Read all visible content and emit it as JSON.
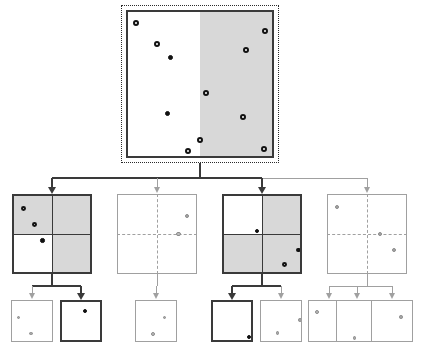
{
  "figure": {
    "type": "diagram",
    "colors": {
      "region_fill_gray": "#d8d8d8",
      "region_fill_white": "#ffffff",
      "active_stroke": "#3a3a3a",
      "inactive_stroke": "#a0a0a0",
      "point_filled": "#111111",
      "point_ring_dark": "#111111",
      "point_gray": "#a8a8a8"
    },
    "levels": 3
  },
  "root": {
    "id": "root-node",
    "label": "root-partition",
    "state": "active",
    "outer_border": "dotted",
    "splits": {
      "vertical": 0.5,
      "horizontal": 0.5
    },
    "quadrants": {
      "tl": "white",
      "tr": "gray",
      "bl": "white",
      "br": "gray"
    },
    "points": [
      {
        "x": 0.07,
        "y": 0.09,
        "style": "ring-dark"
      },
      {
        "x": 0.21,
        "y": 0.23,
        "style": "ring-dark"
      },
      {
        "x": 0.3,
        "y": 0.32,
        "style": "filled"
      },
      {
        "x": 0.94,
        "y": 0.14,
        "style": "ring-dark"
      },
      {
        "x": 0.81,
        "y": 0.27,
        "style": "ring-dark"
      },
      {
        "x": 0.54,
        "y": 0.56,
        "style": "ring-dark"
      },
      {
        "x": 0.28,
        "y": 0.7,
        "style": "filled"
      },
      {
        "x": 0.79,
        "y": 0.72,
        "style": "ring-dark"
      },
      {
        "x": 0.5,
        "y": 0.88,
        "style": "ring-dark"
      },
      {
        "x": 0.42,
        "y": 0.95,
        "style": "ring-dark"
      },
      {
        "x": 0.93,
        "y": 0.94,
        "style": "ring-dark"
      }
    ]
  },
  "level2": [
    {
      "id": "node-l2-1",
      "label": "child-1",
      "state": "active",
      "split_style": "solid",
      "splits": {
        "vertical": 0.5,
        "horizontal": 0.5
      },
      "quadrants": {
        "tl": "gray",
        "tr": "gray",
        "bl": "white",
        "br": "gray"
      },
      "points": [
        {
          "x": 0.14,
          "y": 0.18,
          "style": "ring-dark"
        },
        {
          "x": 0.28,
          "y": 0.38,
          "style": "ring-dark"
        },
        {
          "x": 0.38,
          "y": 0.58,
          "style": "filled"
        }
      ]
    },
    {
      "id": "node-l2-2",
      "label": "child-2",
      "state": "inactive",
      "split_style": "dashed",
      "splits": {
        "vertical": 0.5,
        "horizontal": 0.5
      },
      "quadrants": {
        "tl": "white",
        "tr": "white",
        "bl": "white",
        "br": "white"
      },
      "points": [
        {
          "x": 0.87,
          "y": 0.28,
          "style": "gray-solid"
        },
        {
          "x": 0.77,
          "y": 0.5,
          "style": "ring-gray"
        }
      ]
    },
    {
      "id": "node-l2-3",
      "label": "child-3",
      "state": "active",
      "split_style": "solid",
      "splits": {
        "vertical": 0.5,
        "horizontal": 0.5
      },
      "quadrants": {
        "tl": "white",
        "tr": "gray",
        "bl": "gray",
        "br": "gray"
      },
      "points": [
        {
          "x": 0.44,
          "y": 0.46,
          "style": "filled"
        },
        {
          "x": 0.96,
          "y": 0.7,
          "style": "ring-dark"
        },
        {
          "x": 0.78,
          "y": 0.88,
          "style": "ring-dark"
        }
      ]
    },
    {
      "id": "node-l2-4",
      "label": "child-4",
      "state": "inactive",
      "split_style": "dashed",
      "splits": {
        "vertical": 0.5,
        "horizontal": 0.5
      },
      "quadrants": {
        "tl": "white",
        "tr": "white",
        "bl": "white",
        "br": "white"
      },
      "points": [
        {
          "x": 0.13,
          "y": 0.16,
          "style": "gray-solid"
        },
        {
          "x": 0.66,
          "y": 0.5,
          "style": "gray-solid"
        },
        {
          "x": 0.84,
          "y": 0.7,
          "style": "gray-solid"
        }
      ]
    }
  ],
  "level3": [
    {
      "id": "node-l3-1",
      "label": "leaf-1",
      "state": "inactive",
      "parent": "node-l2-1",
      "points": [
        {
          "x": 0.18,
          "y": 0.42,
          "style": "gray-solid"
        },
        {
          "x": 0.47,
          "y": 0.8,
          "style": "gray-solid"
        }
      ]
    },
    {
      "id": "node-l3-2",
      "label": "leaf-2",
      "state": "active",
      "parent": "node-l2-1",
      "points": [
        {
          "x": 0.6,
          "y": 0.26,
          "style": "filled"
        }
      ]
    },
    {
      "id": "node-l3-3",
      "label": "leaf-3",
      "state": "inactive",
      "parent": "node-l2-2",
      "points": [
        {
          "x": 0.7,
          "y": 0.42,
          "style": "gray-solid"
        },
        {
          "x": 0.44,
          "y": 0.82,
          "style": "ring-gray"
        }
      ]
    },
    {
      "id": "node-l3-4",
      "label": "leaf-4",
      "state": "active",
      "parent": "node-l2-3",
      "points": [
        {
          "x": 0.9,
          "y": 0.88,
          "style": "filled"
        }
      ]
    },
    {
      "id": "node-l3-5",
      "label": "leaf-5",
      "state": "inactive",
      "parent": "node-l2-3",
      "points": [
        {
          "x": 0.95,
          "y": 0.48,
          "style": "gray-solid"
        },
        {
          "x": 0.42,
          "y": 0.78,
          "style": "gray-solid"
        }
      ]
    },
    {
      "id": "node-l3-6",
      "label": "leaf-6",
      "state": "inactive",
      "parent": "node-l2-4",
      "points": [
        {
          "x": 0.22,
          "y": 0.28,
          "style": "ring-gray"
        }
      ]
    },
    {
      "id": "node-l3-7",
      "label": "leaf-7",
      "state": "inactive",
      "parent": "node-l2-4",
      "points": [
        {
          "x": 0.44,
          "y": 0.9,
          "style": "gray-solid"
        }
      ]
    },
    {
      "id": "node-l3-8",
      "label": "leaf-8",
      "state": "inactive",
      "parent": "node-l2-4",
      "points": [
        {
          "x": 0.72,
          "y": 0.4,
          "style": "gray-solid"
        }
      ]
    }
  ],
  "geometry": {
    "root": {
      "x": 126,
      "y": 10,
      "w": 148,
      "h": 148
    },
    "level2": [
      {
        "x": 12,
        "y": 194,
        "w": 80,
        "h": 80
      },
      {
        "x": 117,
        "y": 194,
        "w": 80,
        "h": 80
      },
      {
        "x": 222,
        "y": 194,
        "w": 80,
        "h": 80
      },
      {
        "x": 327,
        "y": 194,
        "w": 80,
        "h": 80
      }
    ],
    "level3": [
      {
        "x": 11,
        "y": 300,
        "w": 42,
        "h": 42
      },
      {
        "x": 60,
        "y": 300,
        "w": 42,
        "h": 42
      },
      {
        "x": 135,
        "y": 300,
        "w": 42,
        "h": 42
      },
      {
        "x": 211,
        "y": 300,
        "w": 42,
        "h": 42
      },
      {
        "x": 260,
        "y": 300,
        "w": 42,
        "h": 42
      },
      {
        "x": 308,
        "y": 300,
        "w": 42,
        "h": 42
      },
      {
        "x": 336,
        "y": 300,
        "w": 42,
        "h": 42
      },
      {
        "x": 371,
        "y": 300,
        "w": 42,
        "h": 42
      }
    ]
  }
}
